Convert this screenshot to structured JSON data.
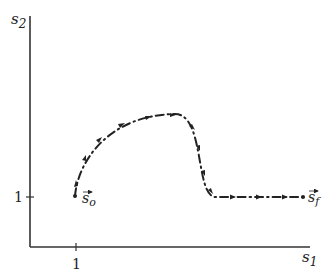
{
  "diagram": {
    "type": "trajectory-plot",
    "axes": {
      "x_label": "s",
      "x_label_sub": "1",
      "y_label": "s",
      "y_label_sub": "2",
      "x_tick_label": "1",
      "y_tick_label": "1"
    },
    "points": {
      "start": {
        "label": "s",
        "sub": "o",
        "vector": true
      },
      "end": {
        "label": "s",
        "sub": "f",
        "vector": true
      }
    },
    "path_style": "dash-dot with arrowheads",
    "colors": {
      "ink": "#222222",
      "background": "#ffffff"
    }
  }
}
